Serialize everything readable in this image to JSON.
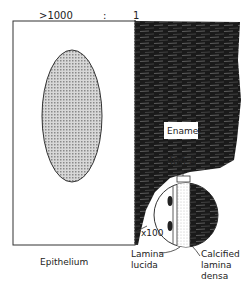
{
  "diagram": {
    "scale_top": ">1000",
    "scale_colon": ":",
    "scale_right": "1",
    "enamel_label": "Enamel",
    "angstrom_label": "400 Å",
    "magnification_label": "x100",
    "epithelium_label": "Epithelium",
    "lamina_lucida_label": [
      "Lamina",
      "lucida"
    ],
    "calcified_lamina_densa_label": [
      "Calcified",
      "lamina",
      "densa"
    ],
    "colors": {
      "ink": "#222222",
      "enamel": "#1a1a1a",
      "cell": "#b8b8b8"
    }
  }
}
